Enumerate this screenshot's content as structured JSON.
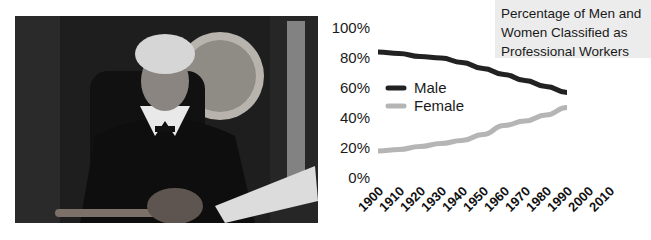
{
  "photo": {
    "description": "Black-and-white photo of a female judge seated at a bench with a gavel and open book"
  },
  "chart_data": {
    "type": "line",
    "title_lines": [
      "Percentage of Men and",
      "Women Classified as",
      "Professional Workers"
    ],
    "title": "Percentage of Men and Women Classified as Professional Workers",
    "xlabel": "",
    "ylabel": "",
    "x": [
      1900,
      1910,
      1920,
      1930,
      1940,
      1950,
      1960,
      1970,
      1980,
      1990
    ],
    "x_tick_labels": [
      "1900",
      "1910",
      "1920",
      "1930",
      "1940",
      "1950",
      "1960",
      "1970",
      "1980",
      "1990",
      "2000",
      "2010"
    ],
    "y_tick_labels": [
      "0%",
      "20%",
      "40%",
      "60%",
      "80%",
      "100%"
    ],
    "ylim": [
      0,
      100
    ],
    "xlim": [
      1900,
      2010
    ],
    "grid": false,
    "legend_position": "center-left",
    "series": [
      {
        "name": "Male",
        "color": "#222222",
        "values": [
          84,
          83,
          81,
          80,
          77,
          73,
          69,
          65,
          61,
          57
        ]
      },
      {
        "name": "Female",
        "color": "#b5b5b5",
        "values": [
          18,
          19,
          21,
          23,
          25,
          29,
          35,
          38,
          42,
          47
        ]
      }
    ]
  }
}
